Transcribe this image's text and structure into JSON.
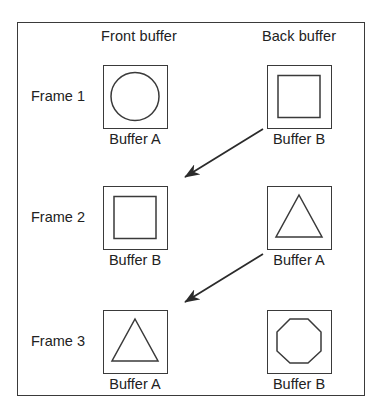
{
  "diagram": {
    "columns": [
      {
        "id": "front",
        "label": "Front buffer"
      },
      {
        "id": "back",
        "label": "Back buffer"
      }
    ],
    "rows": [
      {
        "id": "frame-1",
        "label": "Frame 1",
        "front": {
          "caption": "Buffer A",
          "shape": "circle"
        },
        "back": {
          "caption": "Buffer B",
          "shape": "square"
        }
      },
      {
        "id": "frame-2",
        "label": "Frame 2",
        "front": {
          "caption": "Buffer B",
          "shape": "square"
        },
        "back": {
          "caption": "Buffer A",
          "shape": "triangle"
        }
      },
      {
        "id": "frame-3",
        "label": "Frame 3",
        "front": {
          "caption": "Buffer A",
          "shape": "triangle"
        },
        "back": {
          "caption": "Buffer B",
          "shape": "octagon"
        }
      }
    ],
    "arrows": [
      {
        "id": "swap-arrow-1",
        "from": "frame-1-back-buffer",
        "to": "frame-2-front-buffer",
        "direction": "down-left"
      },
      {
        "id": "swap-arrow-2",
        "from": "frame-2-back-buffer",
        "to": "frame-3-front-buffer",
        "direction": "down-left"
      }
    ],
    "colors": {
      "stroke": "#3a3a3a",
      "text": "#222222",
      "background": "#ffffff"
    }
  }
}
